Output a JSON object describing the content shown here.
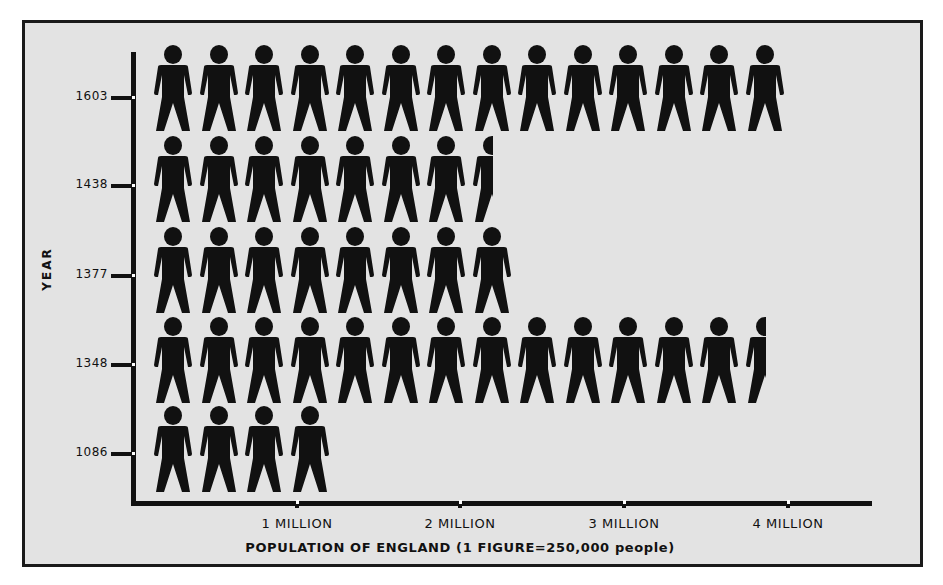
{
  "chart_data": {
    "type": "bar",
    "style": "pictogram",
    "title": "",
    "xlabel": "POPULATION OF ENGLAND (1 FIGURE=250,000 people)",
    "ylabel": "YEAR",
    "unit_per_figure": 250000,
    "categories": [
      "1603",
      "1438",
      "1377",
      "1348",
      "1086"
    ],
    "figures": [
      14,
      7.5,
      8,
      13.5,
      4
    ],
    "values": [
      3500000,
      1875000,
      2000000,
      3375000,
      1000000
    ],
    "x_ticks": [
      "1 MILLION",
      "2 MILLION",
      "3 MILLION",
      "4 MILLION"
    ],
    "xlim": [
      0,
      4500000
    ],
    "grid": false,
    "legend": "none",
    "colors": {
      "figure": "#111111",
      "background": "#e3e3e3",
      "border": "#1a1a1a"
    }
  },
  "axis": {
    "y_title": "YEAR",
    "x_title": "POPULATION OF ENGLAND (1 FIGURE=250,000 people)",
    "y_ticks": [
      "1603",
      "1438",
      "1377",
      "1348",
      "1086"
    ],
    "x_ticks": [
      "1 MILLION",
      "2 MILLION",
      "3 MILLION",
      "4 MILLION"
    ]
  }
}
